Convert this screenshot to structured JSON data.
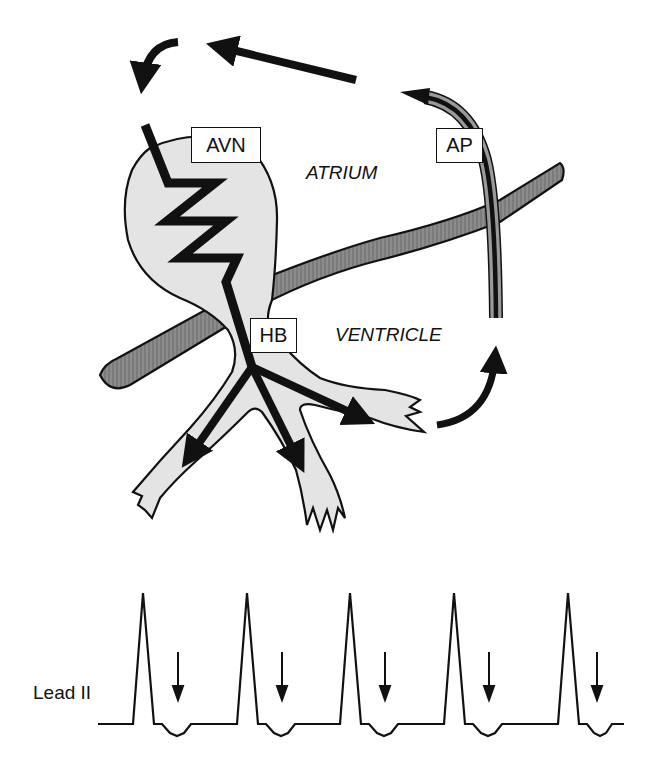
{
  "diagram": {
    "labels": {
      "avn": "AVN",
      "ap": "AP",
      "hb": "HB",
      "atrium": "ATRIUM",
      "ventricle": "VENTRICLE"
    },
    "colors": {
      "tissue_fill": "#e4e4e4",
      "annulus_fill": "#8c8c8c",
      "stroke": "#111111",
      "background": "#ffffff"
    }
  },
  "ecg": {
    "lead_label": "Lead II",
    "beats": 5,
    "complex_x": [
      143,
      247,
      350,
      454,
      568
    ],
    "arrow_x": [
      178,
      282,
      385,
      489,
      597
    ],
    "baseline_y": 724,
    "peak_y": 593,
    "trough_y": 735
  }
}
